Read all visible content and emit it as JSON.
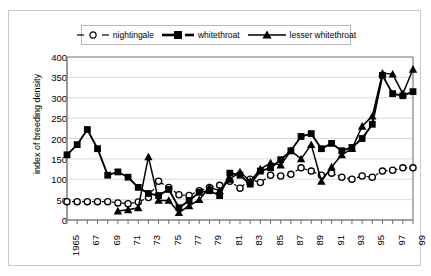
{
  "chart_data": {
    "type": "line",
    "title": "",
    "xlabel": "",
    "ylabel": "index of breeding density",
    "ylim": [
      0,
      400
    ],
    "ytick_values": [
      0,
      50,
      100,
      150,
      200,
      250,
      300,
      350,
      400
    ],
    "xlim": [
      1965,
      1999
    ],
    "grid": true,
    "legend_position": "top",
    "x": [
      1965,
      1966,
      1967,
      1968,
      1969,
      1970,
      1971,
      1972,
      1973,
      1974,
      1975,
      1976,
      1977,
      1978,
      1979,
      1980,
      1981,
      1982,
      1983,
      1984,
      1985,
      1986,
      1987,
      1988,
      1989,
      1990,
      1991,
      1992,
      1993,
      1994,
      1995,
      1996,
      1997,
      1998,
      1999
    ],
    "xtick_labels": [
      "1965",
      "",
      "67",
      "",
      "69",
      "",
      "71",
      "",
      "73",
      "",
      "75",
      "",
      "77",
      "",
      "79",
      "",
      "81",
      "",
      "83",
      "",
      "85",
      "",
      "87",
      "",
      "89",
      "",
      "91",
      "",
      "93",
      "",
      "95",
      "",
      "97",
      "",
      "99"
    ],
    "series": [
      {
        "name": "nightingale",
        "marker": "open-circle",
        "line": "dashed",
        "values": [
          45,
          45,
          45,
          45,
          45,
          42,
          40,
          44,
          55,
          95,
          80,
          62,
          60,
          72,
          80,
          85,
          95,
          78,
          100,
          92,
          110,
          108,
          112,
          128,
          120,
          110,
          115,
          105,
          100,
          108,
          105,
          120,
          122,
          128,
          128
        ]
      },
      {
        "name": "whitethroat",
        "marker": "filled-square",
        "line": "solid",
        "values": [
          160,
          185,
          222,
          175,
          110,
          118,
          105,
          80,
          65,
          60,
          75,
          30,
          48,
          68,
          72,
          60,
          115,
          110,
          88,
          120,
          128,
          148,
          170,
          205,
          212,
          175,
          188,
          170,
          178,
          200,
          235,
          355,
          310,
          305,
          315
        ]
      },
      {
        "name": "lesser whitethroat",
        "marker": "filled-triangle",
        "line": "solid",
        "values": [
          null,
          null,
          null,
          null,
          null,
          22,
          25,
          30,
          155,
          48,
          48,
          18,
          35,
          50,
          80,
          72,
          100,
          118,
          95,
          125,
          140,
          135,
          170,
          150,
          185,
          95,
          130,
          160,
          175,
          230,
          255,
          360,
          358,
          310,
          370
        ]
      }
    ]
  },
  "legend": {
    "items": [
      {
        "label": "nightingale",
        "icon": "open-circle-dashed-icon"
      },
      {
        "label": "whitethroat",
        "icon": "filled-square-solid-icon"
      },
      {
        "label": "lesser whitethroat",
        "icon": "filled-triangle-solid-icon"
      }
    ]
  },
  "axes": {
    "y_title": "index of breeding density"
  }
}
